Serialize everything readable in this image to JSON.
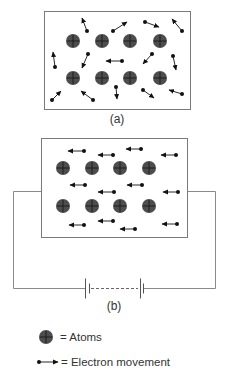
{
  "diagram": {
    "colors": {
      "frame": "#7a7a7a",
      "wire": "#8a8a8a",
      "atom_fill": "#4d4d4d",
      "atom_cross": "#1a1a1a",
      "electron": "#111111",
      "text": "#333333"
    },
    "panel_a": {
      "label": "(a)",
      "description": "Random electron movement with no applied voltage",
      "box": {
        "x": 44,
        "y": 11,
        "w": 146,
        "h": 98
      },
      "atoms": [
        [
          73,
          41
        ],
        [
          102,
          41
        ],
        [
          130,
          41
        ],
        [
          160,
          41
        ],
        [
          73,
          78
        ],
        [
          102,
          78
        ],
        [
          130,
          78
        ],
        [
          160,
          78
        ]
      ],
      "electrons": [
        {
          "dot": [
            87,
            31
          ],
          "tip": [
            82,
            18
          ]
        },
        {
          "dot": [
            113,
            31
          ],
          "tip": [
            127,
            22
          ]
        },
        {
          "dot": [
            145,
            22
          ],
          "tip": [
            159,
            27
          ]
        },
        {
          "dot": [
            182,
            31
          ],
          "tip": [
            172,
            19
          ]
        },
        {
          "dot": [
            55,
            67
          ],
          "tip": [
            53,
            52
          ]
        },
        {
          "dot": [
            88,
            54
          ],
          "tip": [
            82,
            68
          ]
        },
        {
          "dot": [
            122,
            61
          ],
          "tip": [
            106,
            61
          ]
        },
        {
          "dot": [
            152,
            54
          ],
          "tip": [
            143,
            64
          ]
        },
        {
          "dot": [
            173,
            56
          ],
          "tip": [
            176,
            70
          ]
        },
        {
          "dot": [
            52,
            100
          ],
          "tip": [
            61,
            91
          ]
        },
        {
          "dot": [
            93,
            100
          ],
          "tip": [
            81,
            91
          ]
        },
        {
          "dot": [
            116,
            87
          ],
          "tip": [
            117,
            99
          ]
        },
        {
          "dot": [
            143,
            90
          ],
          "tip": [
            154,
            98
          ]
        },
        {
          "dot": [
            182,
            94
          ],
          "tip": [
            169,
            90
          ]
        }
      ]
    },
    "panel_b": {
      "label": "(b)",
      "description": "Directed electron flow with battery connected",
      "box": {
        "x": 41,
        "y": 138,
        "w": 146,
        "h": 99
      },
      "atoms": [
        [
          63,
          168
        ],
        [
          92,
          168
        ],
        [
          120,
          168
        ],
        [
          149,
          168
        ],
        [
          63,
          206
        ],
        [
          92,
          206
        ],
        [
          120,
          206
        ],
        [
          149,
          206
        ]
      ],
      "electrons": [
        {
          "dot": [
            84,
            151
          ],
          "tip": [
            68,
            151
          ]
        },
        {
          "dot": [
            113,
            155
          ],
          "tip": [
            98,
            155
          ]
        },
        {
          "dot": [
            141,
            149
          ],
          "tip": [
            126,
            149
          ]
        },
        {
          "dot": [
            176,
            155
          ],
          "tip": [
            161,
            155
          ]
        },
        {
          "dot": [
            85,
            185
          ],
          "tip": [
            70,
            185
          ]
        },
        {
          "dot": [
            114,
            192
          ],
          "tip": [
            98,
            192
          ]
        },
        {
          "dot": [
            142,
            185
          ],
          "tip": [
            127,
            185
          ]
        },
        {
          "dot": [
            178,
            192
          ],
          "tip": [
            163,
            192
          ]
        },
        {
          "dot": [
            84,
            225
          ],
          "tip": [
            69,
            225
          ]
        },
        {
          "dot": [
            113,
            221
          ],
          "tip": [
            98,
            221
          ]
        },
        {
          "dot": [
            135,
            229
          ],
          "tip": [
            120,
            229
          ]
        },
        {
          "dot": [
            177,
            224
          ],
          "tip": [
            162,
            224
          ]
        }
      ],
      "circuit": {
        "wire_y_top": 191,
        "wire_x_left": 13,
        "wire_x_right": 215,
        "wire_y_bottom": 288,
        "battery": {
          "long_plates_x": [
            85,
            140
          ],
          "short_plates_x": [
            89,
            143
          ],
          "long_half_height": 10,
          "short_half_height": 5,
          "dashed_from": 91,
          "dashed_to": 138
        }
      }
    },
    "legend": {
      "atoms_label": "= Atoms",
      "electron_label": "= Electron movement",
      "atom_icon": [
        46,
        337
      ],
      "electron_icon": {
        "dot": [
          39,
          362
        ],
        "tip": [
          58,
          362
        ]
      }
    }
  }
}
